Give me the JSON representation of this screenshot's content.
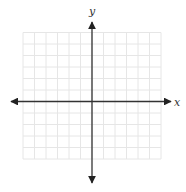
{
  "figure": {
    "type": "coordinate-plane",
    "x_axis_label": "x",
    "y_axis_label": "y",
    "grid": {
      "columns": 12,
      "rows": 11,
      "columns_left_of_y_axis": 6,
      "rows_above_x_axis": 6,
      "line_color": "#e6e6e6"
    },
    "axis_color": "#333333"
  }
}
